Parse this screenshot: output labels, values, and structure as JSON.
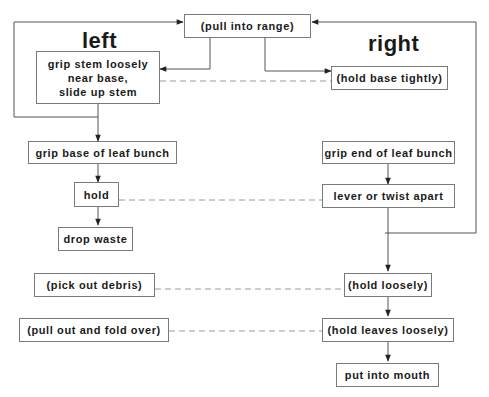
{
  "headings": {
    "left": "left",
    "right": "right"
  },
  "nodes": {
    "pull_into_range": "(pull into range)",
    "grip_stem": "grip stem loosely\nnear base,\nslide up stem",
    "hold_base_tightly": "(hold base tightly)",
    "grip_base_leaf": "grip base of leaf bunch",
    "grip_end_leaf": "grip end of leaf bunch",
    "hold": "hold",
    "lever_twist": "lever or twist apart",
    "drop_waste": "drop waste",
    "pick_debris": "(pick out debris)",
    "hold_loosely": "(hold loosely)",
    "pull_fold": "(pull out and fold over)",
    "hold_leaves_loosely": "(hold leaves loosely)",
    "put_mouth": "put into mouth"
  },
  "colors": {
    "line": "#555555",
    "dashed": "#9a9a9a",
    "box_border": "#7a7a7a"
  }
}
